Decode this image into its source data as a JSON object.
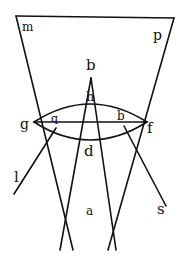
{
  "diagram": {
    "type": "optics-lens-ray-diagram",
    "colors": {
      "ink": "#111111",
      "background": "#ffffff"
    },
    "labels": {
      "m": "m",
      "p": "p",
      "b": "b",
      "h": "h",
      "g": "g",
      "q": "q",
      "b2": "b",
      "f": "f",
      "d": "d",
      "l": "l",
      "s": "s",
      "a": "a"
    }
  }
}
